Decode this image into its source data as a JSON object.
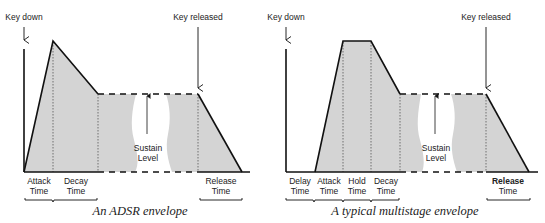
{
  "colors": {
    "fill": "#d4d4d4",
    "stroke": "#111111",
    "text": "#222222",
    "background": "#ffffff"
  },
  "left_diagram": {
    "caption": "An ADSR envelope",
    "key_down_label": "Key down",
    "key_released_label": "Key released",
    "sustain_label_line1": "Sustain",
    "sustain_label_line2": "Level",
    "stages": [
      {
        "line1": "Attack",
        "line2": "Time"
      },
      {
        "line1": "Decay",
        "line2": "Time"
      },
      {
        "line1": "Release",
        "line2": "Time"
      }
    ]
  },
  "right_diagram": {
    "caption": "A typical multistage envelope",
    "key_down_label": "Key down",
    "key_released_label": "Key released",
    "sustain_label_line1": "Sustain",
    "sustain_label_line2": "Level",
    "stages": [
      {
        "line1": "Delay",
        "line2": "Time"
      },
      {
        "line1": "Attack",
        "line2": "Time"
      },
      {
        "line1": "Hold",
        "line2": "Time"
      },
      {
        "line1": "Decay",
        "line2": "Time"
      },
      {
        "line1": "Release",
        "line2": "Time"
      }
    ]
  }
}
